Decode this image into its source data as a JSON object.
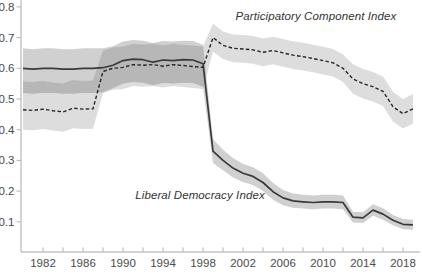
{
  "chart_data": {
    "type": "line",
    "title": "",
    "xlabel": "",
    "ylabel": "",
    "xlim": [
      1980,
      2020
    ],
    "ylim": [
      0,
      0.82
    ],
    "grid": false,
    "legend": "inline-annotations",
    "background_color": "#ffffff",
    "axis_color": "#a8a8a8",
    "tick_color": "#b5b5b5",
    "tick_label_color": "#4a4a4a",
    "annotation_color": "#333333",
    "x": [
      1980,
      1981,
      1982,
      1983,
      1984,
      1985,
      1986,
      1987,
      1988,
      1989,
      1990,
      1991,
      1992,
      1993,
      1994,
      1995,
      1996,
      1997,
      1998,
      1999,
      2000,
      2001,
      2002,
      2003,
      2004,
      2005,
      2006,
      2007,
      2008,
      2009,
      2010,
      2011,
      2012,
      2013,
      2014,
      2015,
      2016,
      2017,
      2018,
      2019
    ],
    "yticks": [
      0.1,
      0.2,
      0.3,
      0.4,
      0.5,
      0.6,
      0.7,
      0.8
    ],
    "ytick_labels": [
      "0.1",
      "0.2",
      "0.3",
      "0.4",
      "0.5",
      "0.6",
      "0.7",
      "0.8"
    ],
    "xticks_labeled": [
      1982,
      1986,
      1990,
      1994,
      1998,
      2002,
      2006,
      2010,
      2014,
      2018
    ],
    "xtick_labels": [
      "1982",
      "1986",
      "1990",
      "1994",
      "1998",
      "2002",
      "2006",
      "2010",
      "2014",
      "2018"
    ],
    "xticks_minor": [
      1984,
      1988,
      1992,
      1996,
      2000,
      2004,
      2008,
      2012,
      2016
    ],
    "series": [
      {
        "name": "Liberal Democracy Index",
        "style": "solid",
        "line_color": "#3a3a3a",
        "band_color": "rgba(85,85,85,0.28)",
        "values": [
          0.6,
          0.597,
          0.6,
          0.6,
          0.597,
          0.597,
          0.6,
          0.6,
          0.602,
          0.61,
          0.625,
          0.63,
          0.628,
          0.62,
          0.627,
          0.625,
          0.628,
          0.627,
          0.615,
          0.33,
          0.3,
          0.275,
          0.258,
          0.248,
          0.228,
          0.198,
          0.178,
          0.168,
          0.165,
          0.163,
          0.165,
          0.165,
          0.163,
          0.115,
          0.113,
          0.138,
          0.125,
          0.105,
          0.092,
          0.09
        ],
        "upper": [
          0.665,
          0.662,
          0.665,
          0.665,
          0.662,
          0.662,
          0.665,
          0.665,
          0.665,
          0.672,
          0.687,
          0.692,
          0.69,
          0.682,
          0.689,
          0.687,
          0.69,
          0.689,
          0.677,
          0.37,
          0.335,
          0.308,
          0.288,
          0.278,
          0.258,
          0.226,
          0.204,
          0.192,
          0.188,
          0.186,
          0.188,
          0.188,
          0.186,
          0.133,
          0.131,
          0.157,
          0.144,
          0.122,
          0.109,
          0.107
        ],
        "lower": [
          0.52,
          0.517,
          0.52,
          0.52,
          0.517,
          0.517,
          0.52,
          0.52,
          0.522,
          0.535,
          0.55,
          0.555,
          0.553,
          0.545,
          0.552,
          0.55,
          0.553,
          0.552,
          0.54,
          0.292,
          0.268,
          0.244,
          0.23,
          0.22,
          0.2,
          0.172,
          0.154,
          0.146,
          0.143,
          0.141,
          0.143,
          0.143,
          0.141,
          0.098,
          0.096,
          0.12,
          0.107,
          0.089,
          0.076,
          0.074
        ]
      },
      {
        "name": "Participatory Component Index",
        "style": "dashed",
        "line_color": "#262626",
        "band_color": "rgba(130,130,130,0.27)",
        "values": [
          0.465,
          0.463,
          0.467,
          0.462,
          0.458,
          0.47,
          0.467,
          0.468,
          0.59,
          0.6,
          0.603,
          0.612,
          0.61,
          0.612,
          0.607,
          0.612,
          0.609,
          0.606,
          0.603,
          0.7,
          0.675,
          0.665,
          0.663,
          0.66,
          0.652,
          0.658,
          0.65,
          0.643,
          0.638,
          0.632,
          0.625,
          0.618,
          0.6,
          0.565,
          0.55,
          0.54,
          0.525,
          0.475,
          0.452,
          0.468
        ],
        "upper": [
          0.557,
          0.555,
          0.559,
          0.554,
          0.55,
          0.562,
          0.559,
          0.56,
          0.658,
          0.668,
          0.671,
          0.68,
          0.678,
          0.68,
          0.675,
          0.68,
          0.677,
          0.674,
          0.671,
          0.745,
          0.72,
          0.71,
          0.708,
          0.705,
          0.697,
          0.703,
          0.695,
          0.688,
          0.683,
          0.677,
          0.67,
          0.663,
          0.645,
          0.613,
          0.598,
          0.588,
          0.573,
          0.523,
          0.5,
          0.516
        ],
        "lower": [
          0.4,
          0.398,
          0.402,
          0.397,
          0.393,
          0.405,
          0.402,
          0.403,
          0.52,
          0.53,
          0.533,
          0.542,
          0.54,
          0.542,
          0.537,
          0.542,
          0.539,
          0.536,
          0.533,
          0.655,
          0.63,
          0.62,
          0.618,
          0.615,
          0.607,
          0.613,
          0.605,
          0.598,
          0.593,
          0.587,
          0.58,
          0.573,
          0.555,
          0.517,
          0.502,
          0.492,
          0.477,
          0.427,
          0.404,
          0.42
        ]
      }
    ],
    "annotations": [
      {
        "text": "Participatory Component Index"
      },
      {
        "text": "Liberal Democracy Index"
      }
    ]
  }
}
